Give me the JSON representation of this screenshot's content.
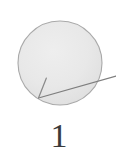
{
  "figure": {
    "caption": "1",
    "background_color": "#ffffff",
    "shape": {
      "kind": "circle",
      "fill_color": "#e7e7e7",
      "stroke_color": "#a9a9a9",
      "center_x": 60,
      "center_y": 63,
      "radius": 42
    },
    "callout": {
      "kind": "leader-line-with-arrowhead",
      "line_color": "#7a7a7a",
      "start_x": 116,
      "start_y": 76,
      "end_x": 38,
      "end_y": 98,
      "barb_start_x": 46,
      "barb_start_y": 78,
      "points_to": "circle-lower-left-edge"
    }
  }
}
